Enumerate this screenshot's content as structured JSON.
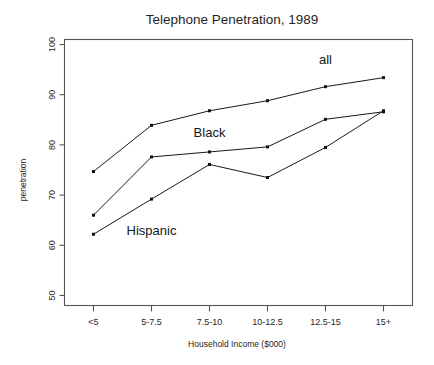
{
  "chart_data": {
    "type": "line",
    "title": "Telephone Penetration, 1989",
    "xlabel": "Household Income ($000)",
    "ylabel": "penetration",
    "categories": [
      "<5",
      "5-7.5",
      "7.5-10",
      "10-12.5",
      "12.5-15",
      "15+"
    ],
    "ylim": [
      48,
      101
    ],
    "yticks": [
      50,
      60,
      70,
      80,
      90,
      100
    ],
    "ytick_labels": [
      "50",
      "60",
      "70",
      "80",
      "90",
      "100"
    ],
    "grid": false,
    "legend": "inline-annotations",
    "series": [
      {
        "name": "all",
        "label": "all",
        "color": "#111111",
        "values": [
          74.7,
          83.9,
          86.8,
          88.8,
          91.6,
          93.4
        ],
        "annotation": {
          "text": "all",
          "category_index": 4,
          "value": 96.2
        }
      },
      {
        "name": "Black",
        "label": "Black",
        "color": "#111111",
        "values": [
          66.0,
          77.6,
          78.6,
          79.6,
          85.1,
          86.6
        ],
        "annotation": {
          "text": "Black",
          "category_index": 2,
          "value": 81.5
        }
      },
      {
        "name": "Hispanic",
        "label": "Hispanic",
        "color": "#111111",
        "values": [
          62.2,
          69.2,
          76.1,
          73.5,
          79.5,
          86.8
        ],
        "annotation": {
          "text": "Hispanic",
          "category_index": 1,
          "value": 62.0
        }
      }
    ]
  }
}
